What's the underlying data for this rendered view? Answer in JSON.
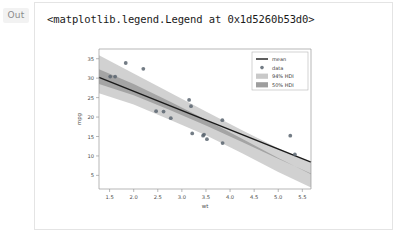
{
  "cell": {
    "out_prompt": "Out",
    "repr_text": "<matplotlib.legend.Legend at 0x1d5260b53d0>"
  },
  "chart_data": {
    "type": "scatter",
    "title": "",
    "xlabel": "wt",
    "ylabel": "mpg",
    "xlim": [
      1.28,
      5.68
    ],
    "ylim": [
      1.5,
      37.5
    ],
    "xticks": [
      "1.5",
      "2.0",
      "2.5",
      "3.0",
      "3.5",
      "4.0",
      "4.5",
      "5.0",
      "5.5"
    ],
    "xtick_values": [
      1.5,
      2.0,
      2.5,
      3.0,
      3.5,
      4.0,
      4.5,
      5.0,
      5.5
    ],
    "yticks": [
      "5",
      "10",
      "15",
      "20",
      "25",
      "30",
      "35"
    ],
    "ytick_values": [
      5,
      10,
      15,
      20,
      25,
      30,
      35
    ],
    "grid": false,
    "legend_position": "upper right",
    "legend": [
      {
        "label": "mean",
        "kind": "line",
        "color": "#1a1a1a"
      },
      {
        "label": "data",
        "kind": "marker",
        "color": "#5a6570"
      },
      {
        "label": "94% HDI",
        "kind": "band",
        "color": "#c9c9c9"
      },
      {
        "label": "50% HDI",
        "kind": "band",
        "color": "#9e9e9e"
      }
    ],
    "series": [
      {
        "name": "data",
        "kind": "scatter",
        "color": "#5a6570",
        "x": [
          1.513,
          1.615,
          1.835,
          2.2,
          2.465,
          2.62,
          2.77,
          3.15,
          3.19,
          3.215,
          3.44,
          3.46,
          3.52,
          3.84,
          3.845,
          5.25,
          5.345
        ],
        "y": [
          30.4,
          30.4,
          33.9,
          32.4,
          21.5,
          21.4,
          19.7,
          24.4,
          22.8,
          15.8,
          15.2,
          15.5,
          14.3,
          19.2,
          13.3,
          15.2,
          10.4
        ]
      },
      {
        "name": "mean",
        "kind": "line",
        "color": "#1a1a1a",
        "x": [
          1.28,
          5.68
        ],
        "y": [
          30.2,
          8.4
        ]
      },
      {
        "name": "94% HDI",
        "kind": "band",
        "color": "#c9c9c9",
        "x": [
          1.28,
          2.0,
          2.75,
          3.5,
          4.25,
          5.0,
          5.68
        ],
        "lower": [
          26.1,
          23.2,
          19.3,
          15.3,
          10.7,
          5.9,
          1.9
        ],
        "upper": [
          35.9,
          31.2,
          26.3,
          21.4,
          16.6,
          12.0,
          8.2
        ]
      },
      {
        "name": "50% HDI",
        "kind": "band",
        "color": "#9e9e9e",
        "x": [
          1.28,
          2.0,
          2.75,
          3.5,
          4.25,
          5.0,
          5.68
        ],
        "lower": [
          28.5,
          25.6,
          21.8,
          17.8,
          13.6,
          9.3,
          5.5
        ],
        "upper": [
          32.3,
          28.5,
          24.0,
          19.3,
          14.4,
          9.5,
          5.3
        ]
      }
    ]
  }
}
